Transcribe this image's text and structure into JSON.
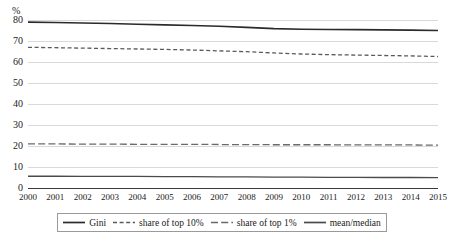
{
  "chart_data": {
    "type": "line",
    "title": "",
    "xlabel": "",
    "ylabel": "%",
    "y_unit_label": "%",
    "grid": true,
    "legend_position": "bottom",
    "xlim": [
      2000,
      2015
    ],
    "ylim": [
      0,
      80
    ],
    "y_ticks": [
      0,
      10,
      20,
      30,
      40,
      50,
      60,
      70,
      80
    ],
    "y_tick_labels": [
      "0",
      "10",
      "20",
      "30",
      "40",
      "50",
      "60",
      "70",
      "80"
    ],
    "x": [
      2000,
      2001,
      2002,
      2003,
      2004,
      2005,
      2006,
      2007,
      2008,
      2009,
      2010,
      2011,
      2012,
      2013,
      2014,
      2015
    ],
    "x_tick_labels": [
      "2000",
      "2001",
      "2002",
      "2003",
      "2004",
      "2005",
      "2006",
      "2007",
      "2008",
      "2009",
      "2010",
      "2011",
      "2012",
      "2013",
      "2014",
      "2015"
    ],
    "series": [
      {
        "name": "Gini",
        "style": "solid",
        "color": "#2b2b2b",
        "width": 1.6,
        "values": [
          79.0,
          78.8,
          78.6,
          78.3,
          78.0,
          77.7,
          77.4,
          77.0,
          76.5,
          75.9,
          75.6,
          75.5,
          75.4,
          75.3,
          75.2,
          75.0
        ]
      },
      {
        "name": "share of top 10%",
        "style": "dashed",
        "color": "#5a5a5a",
        "width": 1.3,
        "values": [
          67.0,
          66.8,
          66.6,
          66.4,
          66.2,
          66.0,
          65.7,
          65.3,
          64.9,
          64.3,
          63.8,
          63.5,
          63.3,
          63.1,
          62.9,
          62.6
        ]
      },
      {
        "name": "share of top 1%",
        "style": "longdash",
        "color": "#6a6a6a",
        "width": 1.3,
        "values": [
          21.0,
          21.0,
          20.9,
          20.9,
          20.8,
          20.8,
          20.8,
          20.7,
          20.7,
          20.6,
          20.6,
          20.6,
          20.5,
          20.5,
          20.5,
          20.4
        ]
      },
      {
        "name": "mean/median",
        "style": "solid",
        "color": "#4a4a4a",
        "width": 1.3,
        "values": [
          5.6,
          5.6,
          5.5,
          5.5,
          5.5,
          5.4,
          5.4,
          5.3,
          5.3,
          5.2,
          5.2,
          5.1,
          5.1,
          5.0,
          5.0,
          4.9
        ]
      }
    ],
    "legend": [
      {
        "label": "Gini",
        "style": "solid"
      },
      {
        "label": "share of top 10%",
        "style": "dashed"
      },
      {
        "label": "share of top 1%",
        "style": "longdash"
      },
      {
        "label": "mean/median",
        "style": "solid"
      }
    ]
  }
}
